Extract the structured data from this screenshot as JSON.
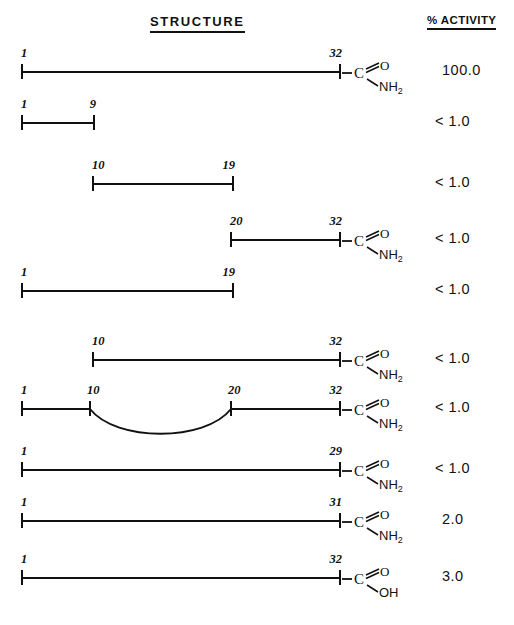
{
  "headers": {
    "structure": "STRUCTURE",
    "activity": "% ACTIVITY"
  },
  "colors": {
    "ink": "#111111",
    "background": "#ffffff"
  },
  "chart_data": {
    "type": "diagram",
    "title": "STRUCTURE",
    "columns": [
      "STRUCTURE",
      "% ACTIVITY"
    ],
    "rows": [
      {
        "index": 1,
        "start_label": "1",
        "end_label": "32",
        "segments": [
          [
            1,
            32
          ]
        ],
        "terminus": "C(=O)NH2",
        "terminus_o": "O",
        "terminus_c": "C",
        "terminus_n": "NH",
        "terminus_sub": "2",
        "loop": false,
        "activity": "100.0"
      },
      {
        "index": 2,
        "start_label": "1",
        "end_label": "9",
        "segments": [
          [
            1,
            9
          ]
        ],
        "terminus": "none",
        "loop": false,
        "activity": "< 1.0"
      },
      {
        "index": 3,
        "start_label": "10",
        "end_label": "19",
        "segments": [
          [
            10,
            19
          ]
        ],
        "terminus": "none",
        "loop": false,
        "activity": "< 1.0"
      },
      {
        "index": 4,
        "start_label": "20",
        "end_label": "32",
        "segments": [
          [
            20,
            32
          ]
        ],
        "terminus": "C(=O)NH2",
        "terminus_o": "O",
        "terminus_c": "C",
        "terminus_n": "NH",
        "terminus_sub": "2",
        "loop": false,
        "activity": "< 1.0"
      },
      {
        "index": 5,
        "start_label": "1",
        "end_label": "19",
        "segments": [
          [
            1,
            19
          ]
        ],
        "terminus": "none",
        "loop": false,
        "activity": "< 1.0"
      },
      {
        "index": 6,
        "start_label": "10",
        "end_label": "32",
        "segments": [
          [
            10,
            32
          ]
        ],
        "terminus": "C(=O)NH2",
        "terminus_o": "O",
        "terminus_c": "C",
        "terminus_n": "NH",
        "terminus_sub": "2",
        "loop": false,
        "activity": "< 1.0"
      },
      {
        "index": 7,
        "start_label": "1",
        "mid_label_left": "10",
        "mid_label_right": "20",
        "end_label": "32",
        "segments": [
          [
            1,
            10
          ],
          [
            20,
            32
          ]
        ],
        "terminus": "C(=O)NH2",
        "terminus_o": "O",
        "terminus_c": "C",
        "terminus_n": "NH",
        "terminus_sub": "2",
        "loop": true,
        "activity": "< 1.0"
      },
      {
        "index": 8,
        "start_label": "1",
        "end_label": "29",
        "segments": [
          [
            1,
            29
          ]
        ],
        "terminus": "C(=O)NH2",
        "terminus_o": "O",
        "terminus_c": "C",
        "terminus_n": "NH",
        "terminus_sub": "2",
        "loop": false,
        "activity": "< 1.0"
      },
      {
        "index": 9,
        "start_label": "1",
        "end_label": "31",
        "segments": [
          [
            1,
            31
          ]
        ],
        "terminus": "C(=O)NH2",
        "terminus_o": "O",
        "terminus_c": "C",
        "terminus_n": "NH",
        "terminus_sub": "2",
        "loop": false,
        "activity": "2.0"
      },
      {
        "index": 10,
        "start_label": "1",
        "end_label": "32",
        "segments": [
          [
            1,
            32
          ]
        ],
        "terminus": "C(=O)OH",
        "terminus_o": "O",
        "terminus_c": "C",
        "terminus_n": "OH",
        "terminus_sub": "",
        "loop": false,
        "activity": "3.0"
      }
    ]
  }
}
